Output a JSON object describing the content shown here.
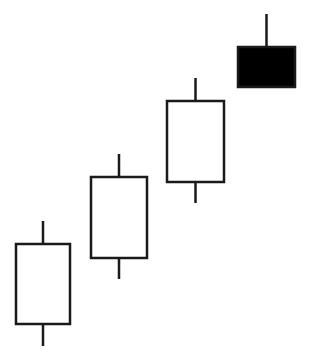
{
  "chart_data": {
    "type": "candlestick",
    "title": "",
    "xlabel": "",
    "ylabel": "",
    "grid": false,
    "legend": null,
    "axes_visible": false,
    "categories": [
      "1",
      "2",
      "3",
      "4"
    ],
    "candles": [
      {
        "open": 3.7,
        "high": 14.0,
        "low": 1.5,
        "close": 11.7,
        "direction": "bullish",
        "fill": "#ffffff"
      },
      {
        "open": 10.3,
        "high": 20.7,
        "low": 8.2,
        "close": 18.4,
        "direction": "bullish",
        "fill": "#ffffff"
      },
      {
        "open": 17.9,
        "high": 28.3,
        "low": 15.8,
        "close": 26.0,
        "direction": "bullish",
        "fill": "#ffffff"
      },
      {
        "open": 31.4,
        "high": 34.7,
        "low": 27.4,
        "close": 27.4,
        "direction": "bearish",
        "fill": "#000000"
      }
    ],
    "ylim": [
      0,
      36.1
    ],
    "colors": {
      "stroke": "#1a1a1a",
      "bullish_fill": "#ffffff",
      "bearish_fill": "#000000",
      "background": "#ffffff"
    }
  },
  "layout": {
    "candle_x_left": [
      16,
      91,
      167,
      238
    ],
    "candle_width": [
      54,
      56,
      57,
      57
    ],
    "px_per_unit": 10,
    "y_origin": 361
  }
}
